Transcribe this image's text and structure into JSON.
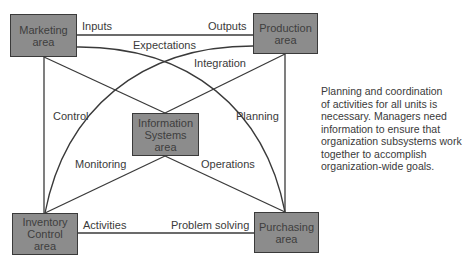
{
  "diagram": {
    "nodes": [
      {
        "id": "marketing",
        "label": "Marketing\narea"
      },
      {
        "id": "production",
        "label": "Production\narea"
      },
      {
        "id": "information",
        "label": "Information\nSystems\narea"
      },
      {
        "id": "inventory",
        "label": "Inventory\nControl\narea"
      },
      {
        "id": "purchasing",
        "label": "Purchasing\narea"
      }
    ],
    "edges": [
      {
        "from": "marketing",
        "to": "production",
        "label_left": "Inputs",
        "label_right": "Outputs"
      },
      {
        "from": "marketing",
        "to": "purchasing",
        "label": "Expectations"
      },
      {
        "from": "production",
        "to": "inventory",
        "label": "Integration"
      },
      {
        "from": "marketing",
        "to": "inventory",
        "label": "Control"
      },
      {
        "from": "production",
        "to": "purchasing",
        "label": "Planning"
      },
      {
        "from": "information",
        "to": "inventory",
        "label": "Monitoring"
      },
      {
        "from": "information",
        "to": "purchasing",
        "label": "Operations"
      },
      {
        "from": "inventory",
        "to": "purchasing",
        "label_left": "Activities",
        "label_right": "Problem solving"
      },
      {
        "from": "marketing",
        "to": "information",
        "label": ""
      },
      {
        "from": "production",
        "to": "information",
        "label": ""
      }
    ],
    "caption": [
      "Planning and coordination",
      "of activities for all units is",
      "necessary. Managers need",
      "information to ensure that",
      "organization subsystems work",
      "together to accomplish",
      "organization-wide goals."
    ],
    "colors": {
      "box_fill": "#8c8c8c",
      "box_border": "#3a3a3a",
      "line": "#3a3a3a",
      "text": "#3a3a3a"
    }
  }
}
